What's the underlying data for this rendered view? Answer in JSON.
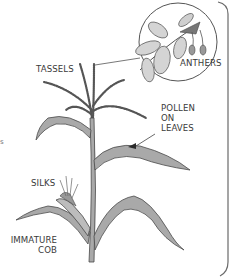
{
  "diagram": {
    "labels": {
      "tassels": "TASSELS",
      "anthers": "ANTHERS",
      "pollen_on_leaves": "POLLEN\nON\nLEAVES",
      "silks": "SILKS",
      "immature_cob": "IMMATURE\nCOB"
    },
    "edge_fragment": "s",
    "colors": {
      "background": "#ffffff",
      "leaf_fill": "#a9a9a9",
      "leaf_light": "#c8c8c8",
      "stroke": "#4a4a4a",
      "pollen": "#2a2a2a",
      "text": "#3a3a3a",
      "frame": "#6a6a6a"
    }
  }
}
